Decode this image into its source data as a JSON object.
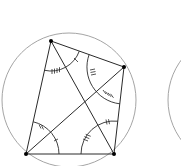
{
  "diagram": {
    "colors": {
      "circle": "#9a9a9a",
      "lines": "#2a2a2a",
      "points": "#000000",
      "background": "#ffffff"
    },
    "circle": {
      "cx": 69,
      "cy": 100,
      "r": 67
    },
    "second_circle": {
      "cx": 235,
      "cy": 100,
      "r": 67
    },
    "vertices": [
      {
        "name": "A",
        "x": 51,
        "y": 41
      },
      {
        "name": "B",
        "x": 124,
        "y": 67
      },
      {
        "name": "C",
        "x": 114,
        "y": 154
      },
      {
        "name": "D",
        "x": 26,
        "y": 154
      }
    ],
    "angle_marks": [
      {
        "at": "A",
        "ticks": 4,
        "label": "angle DAC"
      },
      {
        "at": "A",
        "ticks": 1,
        "label": "angle CAB"
      },
      {
        "at": "B",
        "ticks": 3,
        "label": "angle ABD"
      },
      {
        "at": "B",
        "ticks": 4,
        "label": "angle DBC"
      },
      {
        "at": "C",
        "ticks": 3,
        "label": "angle DCA"
      },
      {
        "at": "C",
        "ticks": 2,
        "label": "angle ACB"
      },
      {
        "at": "D",
        "ticks": 2,
        "label": "angle ADB"
      },
      {
        "at": "D",
        "ticks": 1,
        "label": "angle BDC"
      }
    ]
  }
}
